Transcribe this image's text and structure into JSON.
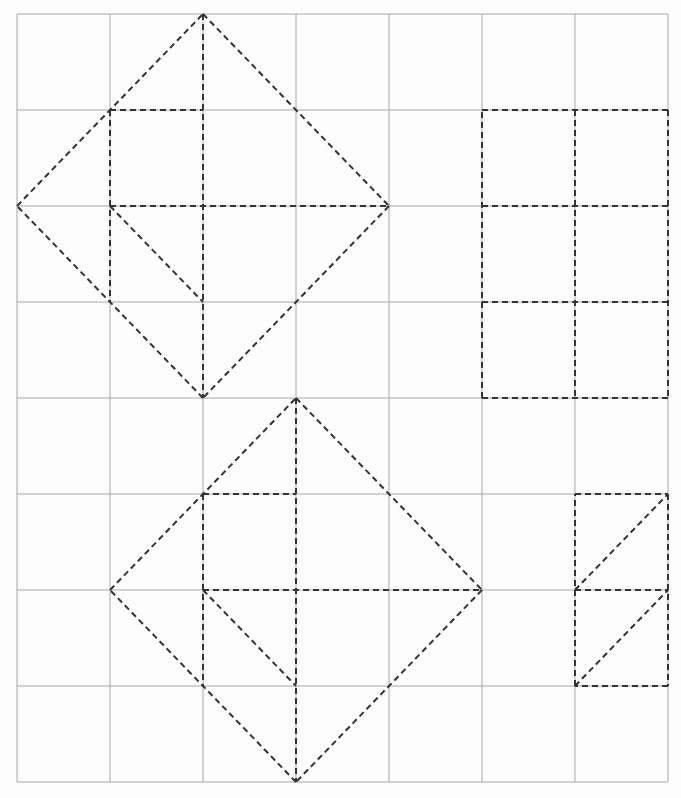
{
  "diagram": {
    "title": "",
    "grid": {
      "columns": 7,
      "rows": 8,
      "x_lines": [
        17,
        110,
        203,
        296,
        389,
        482,
        575,
        668
      ],
      "y_lines": [
        14,
        110,
        206,
        302,
        398,
        494,
        590,
        686,
        782
      ],
      "line_color": "#a8a8a8"
    },
    "dash_color": "#333333",
    "shapes": [
      {
        "name": "upper-diamond",
        "segments": [
          [
            [
              2,
              0
            ],
            [
              4,
              2
            ]
          ],
          [
            [
              4,
              2
            ],
            [
              2,
              4
            ]
          ],
          [
            [
              2,
              4
            ],
            [
              0,
              2
            ]
          ],
          [
            [
              0,
              2
            ],
            [
              2,
              0
            ]
          ],
          [
            [
              1,
              1
            ],
            [
              2,
              1
            ]
          ],
          [
            [
              1,
              2
            ],
            [
              4,
              2
            ]
          ],
          [
            [
              2,
              0
            ],
            [
              2,
              4
            ]
          ],
          [
            [
              1,
              1
            ],
            [
              1,
              3
            ]
          ],
          [
            [
              1,
              2
            ],
            [
              2,
              3
            ]
          ]
        ]
      },
      {
        "name": "lower-diamond",
        "segments": [
          [
            [
              3,
              4
            ],
            [
              5,
              6
            ]
          ],
          [
            [
              5,
              6
            ],
            [
              3,
              8
            ]
          ],
          [
            [
              3,
              8
            ],
            [
              1,
              6
            ]
          ],
          [
            [
              1,
              6
            ],
            [
              3,
              4
            ]
          ],
          [
            [
              2,
              5
            ],
            [
              3,
              5
            ]
          ],
          [
            [
              2,
              6
            ],
            [
              5,
              6
            ]
          ],
          [
            [
              3,
              4
            ],
            [
              3,
              8
            ]
          ],
          [
            [
              2,
              5
            ],
            [
              2,
              7
            ]
          ],
          [
            [
              2,
              6
            ],
            [
              3,
              7
            ]
          ]
        ]
      },
      {
        "name": "right-rectangle-grid",
        "segments": [
          [
            [
              5,
              1
            ],
            [
              7,
              1
            ]
          ],
          [
            [
              7,
              1
            ],
            [
              7,
              4
            ]
          ],
          [
            [
              7,
              4
            ],
            [
              5,
              4
            ]
          ],
          [
            [
              5,
              4
            ],
            [
              5,
              1
            ]
          ],
          [
            [
              6,
              1
            ],
            [
              6,
              4
            ]
          ],
          [
            [
              5,
              2
            ],
            [
              7,
              2
            ]
          ],
          [
            [
              5,
              3
            ],
            [
              7,
              3
            ]
          ]
        ]
      },
      {
        "name": "lower-right-triangles",
        "segments": [
          [
            [
              6,
              5
            ],
            [
              7,
              5
            ]
          ],
          [
            [
              7,
              5
            ],
            [
              7,
              7
            ]
          ],
          [
            [
              7,
              7
            ],
            [
              6,
              7
            ]
          ],
          [
            [
              6,
              7
            ],
            [
              6,
              5
            ]
          ],
          [
            [
              6,
              6
            ],
            [
              7,
              6
            ]
          ],
          [
            [
              6,
              6
            ],
            [
              7,
              5
            ]
          ],
          [
            [
              6,
              7
            ],
            [
              7,
              6
            ]
          ]
        ]
      }
    ]
  }
}
